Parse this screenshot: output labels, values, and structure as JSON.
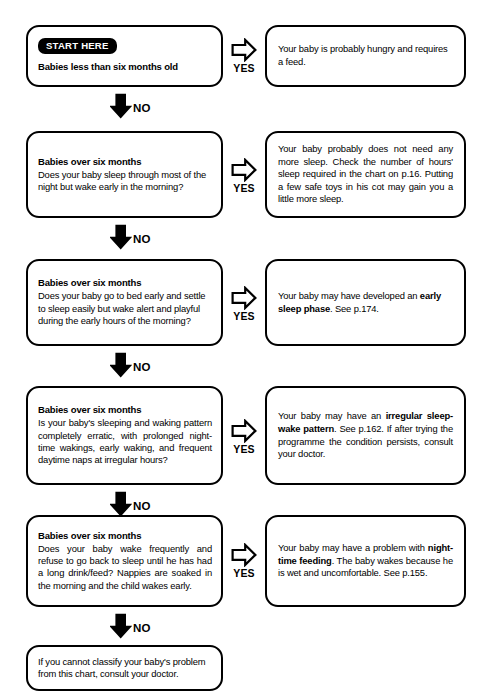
{
  "chart_data": {
    "type": "diagram",
    "orientation": "vertical decision chain with YES branches to the right"
  },
  "labels": {
    "yes": "YES",
    "no": "NO",
    "start_badge": "START HERE"
  },
  "icons": {
    "yes_arrow": "arrow-right-outline-icon",
    "no_arrow": "arrow-down-solid-icon"
  },
  "steps": [
    {
      "id": "step-1",
      "question": {
        "has_start_badge": true,
        "heading": "Babies less than six months old",
        "body": ""
      },
      "answer": {
        "text_parts": [
          {
            "text": "Your baby is probably hungry and requires a feed.",
            "bold": false
          }
        ]
      }
    },
    {
      "id": "step-2",
      "question": {
        "has_start_badge": false,
        "heading": "Babies over six months",
        "body": "Does your baby sleep through most of the night but wake early in the morning?"
      },
      "answer": {
        "text_parts": [
          {
            "text": "Your baby probably does not need any more sleep.  Check the number of hours' sleep required in the chart on p.16. Putting a few safe toys in his cot may gain you a little more sleep.",
            "bold": false
          }
        ]
      }
    },
    {
      "id": "step-3",
      "question": {
        "has_start_badge": false,
        "heading": "Babies over six months",
        "body": "Does your baby go to bed early and settle to sleep easily but wake alert and playful during the early hours of the morning?"
      },
      "answer": {
        "text_parts": [
          {
            "text": "Your baby may have developed an ",
            "bold": false
          },
          {
            "text": "early sleep phase",
            "bold": true
          },
          {
            "text": ".  See p.174.",
            "bold": false
          }
        ]
      }
    },
    {
      "id": "step-4",
      "question": {
        "has_start_badge": false,
        "heading": "Babies over six months",
        "body": "Is your baby's sleeping and waking pattern completely erratic, with prolonged night-time wakings, early waking, and frequent daytime naps at irregular hours?"
      },
      "answer": {
        "text_parts": [
          {
            "text": "Your baby may have an ",
            "bold": false
          },
          {
            "text": "irregular sleep-wake pattern",
            "bold": true
          },
          {
            "text": ". See p.162.  If after trying the programme the condition persists, consult your doctor.",
            "bold": false
          }
        ]
      }
    },
    {
      "id": "step-5",
      "question": {
        "has_start_badge": false,
        "heading": "Babies over six months",
        "body": "Does your baby wake frequently and refuse to go back to sleep until he has had a long drink/feed?  Nappies are soaked in the morning and the child wakes early."
      },
      "answer": {
        "text_parts": [
          {
            "text": "Your baby may have a problem with ",
            "bold": false
          },
          {
            "text": "night-time feeding",
            "bold": true
          },
          {
            "text": ".  The baby wakes because he is wet and uncomfortable. See p.155.",
            "bold": false
          }
        ]
      }
    }
  ],
  "final_box": {
    "text": "If you cannot classify your baby's problem from this chart, consult your doctor."
  }
}
